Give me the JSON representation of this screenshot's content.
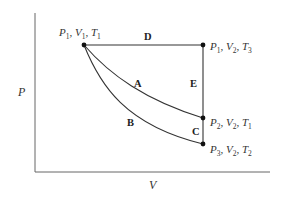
{
  "diagram": {
    "type": "PV diagram",
    "axes": {
      "y_label": "P",
      "x_label": "V"
    },
    "states": [
      {
        "id": "s1",
        "P": "1",
        "V": "1",
        "T": "1"
      },
      {
        "id": "s2",
        "P": "1",
        "V": "2",
        "T": "3"
      },
      {
        "id": "s3",
        "P": "2",
        "V": "2",
        "T": "1"
      },
      {
        "id": "s4",
        "P": "3",
        "V": "2",
        "T": "2"
      }
    ],
    "paths": [
      {
        "label": "A",
        "from": "s1",
        "to": "s3",
        "shape": "curve"
      },
      {
        "label": "B",
        "from": "s1",
        "to": "s4",
        "shape": "curve"
      },
      {
        "label": "C",
        "from": "s3",
        "to": "s4",
        "shape": "vertical"
      },
      {
        "label": "D",
        "from": "s1",
        "to": "s2",
        "shape": "horizontal"
      },
      {
        "label": "E",
        "from": "s2",
        "to": "s3",
        "shape": "vertical"
      }
    ],
    "colors": {
      "line": "#333333",
      "axis": "#555555",
      "point": "#111111",
      "text": "#333333"
    }
  }
}
